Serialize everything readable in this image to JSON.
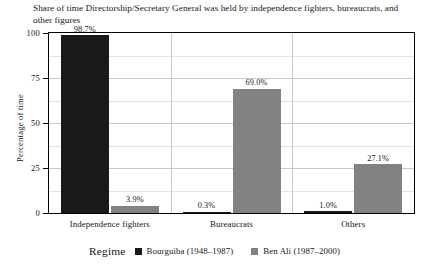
{
  "chart_data": {
    "type": "bar",
    "title": "Share of time Directorship/Secretary General was held by independence fighters, bureaucrats, and other figures",
    "xlabel": "Regime",
    "ylabel": "Percentage of time",
    "ylim": [
      0,
      100
    ],
    "yticks": [
      0,
      25,
      50,
      75,
      100
    ],
    "ytick_labels": [
      "0",
      "25",
      "50",
      "75",
      "100"
    ],
    "grid": true,
    "legend_position": "bottom",
    "categories": [
      "Independence fighters",
      "Bureaucrats",
      "Others"
    ],
    "series": [
      {
        "name": "Bourguiba (1948–1987)",
        "color": "#1a1a1a",
        "values": [
          98.7,
          0.3,
          1.0
        ],
        "data_labels": [
          "98.7%",
          "0.3%",
          "1.0%"
        ]
      },
      {
        "name": "Ben Ali (1987–2000)",
        "color": "#828282",
        "values": [
          3.9,
          69.0,
          27.1
        ],
        "data_labels": [
          "3.9%",
          "69.0%",
          "27.1%"
        ]
      }
    ]
  },
  "legend": {
    "title": "Regime"
  }
}
